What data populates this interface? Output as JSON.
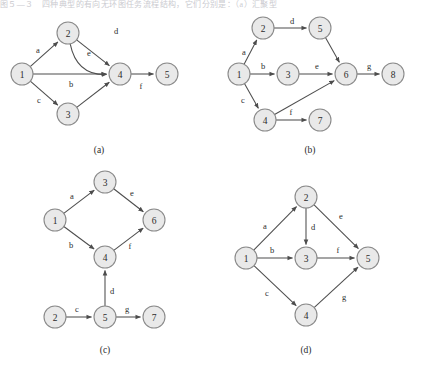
{
  "page": {
    "header_text": "图５―３　四种典型的有向无环图任务流程结构，它们分别是：（a）汇聚型",
    "width": 426,
    "height": 380,
    "background": "#ffffff",
    "node_fill": "#e9e9e9",
    "node_stroke": "#8a8a8a",
    "edge_color": "#4d4d4d",
    "text_color": "#2b2b2b"
  },
  "figures": [
    {
      "id": "a",
      "caption": "(a)",
      "caption_pos": {
        "x": 99,
        "y": 150
      },
      "node_radius": 11,
      "nodes": [
        {
          "id": "n1",
          "label": "1",
          "x": 22,
          "y": 74
        },
        {
          "id": "n2",
          "label": "2",
          "x": 68,
          "y": 33
        },
        {
          "id": "n3",
          "label": "3",
          "x": 68,
          "y": 114
        },
        {
          "id": "n4",
          "label": "4",
          "x": 120,
          "y": 74
        },
        {
          "id": "n5",
          "label": "5",
          "x": 167,
          "y": 74
        }
      ],
      "edges": [
        {
          "from": "n1",
          "to": "n2",
          "label": "a",
          "label_pos": {
            "x": 38,
            "y": 50
          },
          "curved": false
        },
        {
          "from": "n1",
          "to": "n4",
          "label": "b",
          "label_pos": {
            "x": 71,
            "y": 84
          },
          "curved": false
        },
        {
          "from": "n1",
          "to": "n3",
          "label": "c",
          "label_pos": {
            "x": 39,
            "y": 100
          },
          "curved": false
        },
        {
          "from": "n2",
          "to": "n4",
          "label": "d",
          "label_pos": {
            "x": 116,
            "y": 31
          },
          "curved": true,
          "curve_offset": 28
        },
        {
          "from": "n2",
          "to": "n4",
          "label": "e",
          "label_pos": {
            "x": 89,
            "y": 53
          },
          "curved": false
        },
        {
          "from": "n3",
          "to": "n4",
          "label": "",
          "label_pos": {
            "x": 0,
            "y": 0
          },
          "curved": false
        },
        {
          "from": "n4",
          "to": "n5",
          "label": "f",
          "label_pos": {
            "x": 141,
            "y": 86
          },
          "curved": false
        }
      ]
    },
    {
      "id": "b",
      "caption": "(b)",
      "caption_pos": {
        "x": 310,
        "y": 150
      },
      "node_radius": 11,
      "nodes": [
        {
          "id": "n1",
          "label": "1",
          "x": 239,
          "y": 74
        },
        {
          "id": "n2",
          "label": "2",
          "x": 263,
          "y": 28
        },
        {
          "id": "n3",
          "label": "3",
          "x": 288,
          "y": 74
        },
        {
          "id": "n4",
          "label": "4",
          "x": 265,
          "y": 120
        },
        {
          "id": "n5",
          "label": "5",
          "x": 320,
          "y": 28
        },
        {
          "id": "n6",
          "label": "6",
          "x": 346,
          "y": 74
        },
        {
          "id": "n7",
          "label": "7",
          "x": 320,
          "y": 120
        },
        {
          "id": "n8",
          "label": "8",
          "x": 393,
          "y": 74
        }
      ],
      "edges": [
        {
          "from": "n1",
          "to": "n2",
          "label": "a",
          "label_pos": {
            "x": 244,
            "y": 52
          },
          "curved": false
        },
        {
          "from": "n1",
          "to": "n3",
          "label": "b",
          "label_pos": {
            "x": 263,
            "y": 66
          },
          "curved": false
        },
        {
          "from": "n1",
          "to": "n4",
          "label": "c",
          "label_pos": {
            "x": 243,
            "y": 100
          },
          "curved": false
        },
        {
          "from": "n2",
          "to": "n5",
          "label": "d",
          "label_pos": {
            "x": 292,
            "y": 21
          },
          "curved": false
        },
        {
          "from": "n3",
          "to": "n6",
          "label": "e",
          "label_pos": {
            "x": 317,
            "y": 66
          },
          "curved": false
        },
        {
          "from": "n5",
          "to": "n6",
          "label": "",
          "label_pos": {
            "x": 0,
            "y": 0
          },
          "curved": false
        },
        {
          "from": "n4",
          "to": "n6",
          "label": "",
          "label_pos": {
            "x": 0,
            "y": 0
          },
          "curved": false
        },
        {
          "from": "n4",
          "to": "n7",
          "label": "f",
          "label_pos": {
            "x": 291,
            "y": 112
          },
          "curved": false
        },
        {
          "from": "n6",
          "to": "n8",
          "label": "g",
          "label_pos": {
            "x": 369,
            "y": 66
          },
          "curved": false
        }
      ]
    },
    {
      "id": "c",
      "caption": "(c)",
      "caption_pos": {
        "x": 105,
        "y": 350
      },
      "node_radius": 11,
      "nodes": [
        {
          "id": "n1",
          "label": "1",
          "x": 55,
          "y": 220
        },
        {
          "id": "n3",
          "label": "3",
          "x": 105,
          "y": 182
        },
        {
          "id": "n6",
          "label": "6",
          "x": 154,
          "y": 220
        },
        {
          "id": "n4",
          "label": "4",
          "x": 105,
          "y": 257
        },
        {
          "id": "n2",
          "label": "2",
          "x": 55,
          "y": 317
        },
        {
          "id": "n5",
          "label": "5",
          "x": 105,
          "y": 317
        },
        {
          "id": "n7",
          "label": "7",
          "x": 154,
          "y": 317
        }
      ],
      "edges": [
        {
          "from": "n1",
          "to": "n3",
          "label": "a",
          "label_pos": {
            "x": 72,
            "y": 196
          },
          "curved": false
        },
        {
          "from": "n3",
          "to": "n6",
          "label": "e",
          "label_pos": {
            "x": 132,
            "y": 193
          },
          "curved": false
        },
        {
          "from": "n1",
          "to": "n4",
          "label": "b",
          "label_pos": {
            "x": 71,
            "y": 245
          },
          "curved": false
        },
        {
          "from": "n4",
          "to": "n6",
          "label": "f",
          "label_pos": {
            "x": 130,
            "y": 246
          },
          "curved": false
        },
        {
          "from": "n5",
          "to": "n4",
          "label": "d",
          "label_pos": {
            "x": 112,
            "y": 291
          },
          "curved": false
        },
        {
          "from": "n2",
          "to": "n5",
          "label": "c",
          "label_pos": {
            "x": 77,
            "y": 309
          },
          "curved": false
        },
        {
          "from": "n5",
          "to": "n7",
          "label": "g",
          "label_pos": {
            "x": 127,
            "y": 309
          },
          "curved": false
        }
      ]
    },
    {
      "id": "d",
      "caption": "(d)",
      "caption_pos": {
        "x": 306,
        "y": 350
      },
      "node_radius": 11,
      "nodes": [
        {
          "id": "n1",
          "label": "1",
          "x": 246,
          "y": 258
        },
        {
          "id": "n2",
          "label": "2",
          "x": 306,
          "y": 197
        },
        {
          "id": "n3",
          "label": "3",
          "x": 306,
          "y": 258
        },
        {
          "id": "n4",
          "label": "4",
          "x": 306,
          "y": 315
        },
        {
          "id": "n5",
          "label": "5",
          "x": 368,
          "y": 258
        }
      ],
      "edges": [
        {
          "from": "n1",
          "to": "n2",
          "label": "a",
          "label_pos": {
            "x": 265,
            "y": 226
          },
          "curved": false
        },
        {
          "from": "n1",
          "to": "n3",
          "label": "b",
          "label_pos": {
            "x": 272,
            "y": 250
          },
          "curved": false
        },
        {
          "from": "n1",
          "to": "n4",
          "label": "c",
          "label_pos": {
            "x": 267,
            "y": 293
          },
          "curved": false
        },
        {
          "from": "n2",
          "to": "n3",
          "label": "d",
          "label_pos": {
            "x": 313,
            "y": 227
          },
          "curved": false
        },
        {
          "from": "n2",
          "to": "n5",
          "label": "e",
          "label_pos": {
            "x": 341,
            "y": 216
          },
          "curved": false
        },
        {
          "from": "n3",
          "to": "n5",
          "label": "f",
          "label_pos": {
            "x": 338,
            "y": 250
          },
          "curved": false
        },
        {
          "from": "n4",
          "to": "n5",
          "label": "g",
          "label_pos": {
            "x": 344,
            "y": 297
          },
          "curved": false
        }
      ]
    }
  ]
}
